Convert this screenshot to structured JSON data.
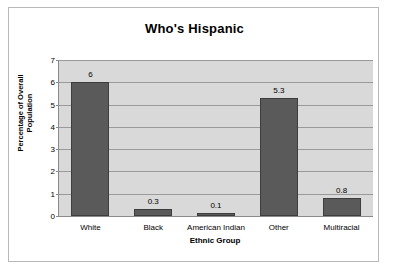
{
  "chart_data": {
    "type": "bar",
    "title": "Who's Hispanic",
    "xlabel": "Ethnic Group",
    "ylabel": "Percentage of Overall Population",
    "ylabel_lines": [
      "Percentage of Overall",
      "Population"
    ],
    "categories": [
      "White",
      "Black",
      "American Indian",
      "Other",
      "Multiracial"
    ],
    "values": [
      6,
      0.3,
      0.1,
      5.3,
      0.8
    ],
    "value_labels": [
      "6",
      "0.3",
      "0.1",
      "5.3",
      "0.8"
    ],
    "ylim": [
      0,
      7
    ],
    "yticks": [
      0,
      1,
      2,
      3,
      4,
      5,
      6,
      7
    ],
    "ytick_labels": [
      "0",
      "1",
      "2",
      "3",
      "4",
      "5",
      "6",
      "7"
    ],
    "grid": true,
    "legend": false,
    "series": [
      {
        "name": "Percentage of Overall Population",
        "values": [
          6,
          0.3,
          0.1,
          5.3,
          0.8
        ]
      }
    ]
  },
  "style": {
    "bar_color": "#5a5a5a",
    "bar_border_color": "#3d3d3d",
    "plot_background": "#d9d9d9",
    "gridline_color": "#9a9a9a",
    "axis_color": "#8a8a8a",
    "canvas_background": "#ffffff",
    "frame_color": "#b8b8b8",
    "text_color": "#000000"
  }
}
